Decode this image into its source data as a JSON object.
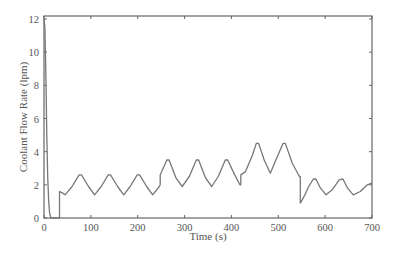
{
  "chart_data": {
    "type": "line",
    "title": "",
    "xlabel": "Time (s)",
    "ylabel": "Coolant Flow Rate (lpm)",
    "xlim": [
      0,
      700
    ],
    "ylim": [
      0,
      12.2
    ],
    "xticks": [
      0,
      100,
      200,
      300,
      400,
      500,
      600,
      700
    ],
    "yticks": [
      0,
      2,
      4,
      6,
      8,
      10,
      12
    ],
    "grid": false,
    "legend": null,
    "series": [
      {
        "name": "Coolant flow rate",
        "color": "#777777",
        "points": [
          [
            0,
            12.0
          ],
          [
            2,
            11.5
          ],
          [
            4,
            8.5
          ],
          [
            6,
            5.0
          ],
          [
            8,
            2.5
          ],
          [
            10,
            1.0
          ],
          [
            12,
            0.3
          ],
          [
            15,
            0.0
          ],
          [
            33,
            0.0
          ],
          [
            33,
            1.6
          ],
          [
            40,
            1.5
          ],
          [
            45,
            1.4
          ],
          [
            60,
            1.9
          ],
          [
            75,
            2.6
          ],
          [
            80,
            2.6
          ],
          [
            95,
            1.9
          ],
          [
            108,
            1.4
          ],
          [
            122,
            1.9
          ],
          [
            137,
            2.6
          ],
          [
            142,
            2.6
          ],
          [
            157,
            1.9
          ],
          [
            170,
            1.4
          ],
          [
            184,
            1.9
          ],
          [
            199,
            2.6
          ],
          [
            204,
            2.6
          ],
          [
            219,
            1.9
          ],
          [
            232,
            1.4
          ],
          [
            246,
            1.9
          ],
          [
            248,
            2.0
          ],
          [
            248,
            2.6
          ],
          [
            262,
            3.5
          ],
          [
            267,
            3.5
          ],
          [
            282,
            2.4
          ],
          [
            295,
            1.9
          ],
          [
            310,
            2.5
          ],
          [
            325,
            3.5
          ],
          [
            330,
            3.5
          ],
          [
            345,
            2.4
          ],
          [
            358,
            1.9
          ],
          [
            372,
            2.5
          ],
          [
            387,
            3.5
          ],
          [
            392,
            3.5
          ],
          [
            407,
            2.6
          ],
          [
            418,
            2.0
          ],
          [
            420,
            2.0
          ],
          [
            420,
            2.6
          ],
          [
            430,
            2.8
          ],
          [
            445,
            3.8
          ],
          [
            453,
            4.5
          ],
          [
            458,
            4.5
          ],
          [
            470,
            3.5
          ],
          [
            483,
            2.7
          ],
          [
            495,
            3.5
          ],
          [
            510,
            4.5
          ],
          [
            515,
            4.5
          ],
          [
            530,
            3.3
          ],
          [
            545,
            2.5
          ],
          [
            547,
            2.5
          ],
          [
            547,
            0.9
          ],
          [
            555,
            1.3
          ],
          [
            565,
            1.9
          ],
          [
            575,
            2.35
          ],
          [
            580,
            2.35
          ],
          [
            590,
            1.8
          ],
          [
            602,
            1.4
          ],
          [
            615,
            1.7
          ],
          [
            630,
            2.3
          ],
          [
            638,
            2.35
          ],
          [
            648,
            1.8
          ],
          [
            660,
            1.4
          ],
          [
            675,
            1.6
          ],
          [
            690,
            2.0
          ],
          [
            700,
            2.1
          ]
        ]
      }
    ]
  }
}
